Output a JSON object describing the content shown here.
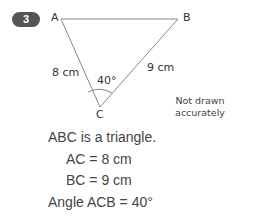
{
  "question_number": "3",
  "diagram": {
    "vertices": {
      "A": "A",
      "B": "B",
      "C": "C"
    },
    "side_labels": {
      "AC": "8 cm",
      "BC": "9 cm"
    },
    "angle_label": "40°",
    "note_line1": "Not drawn",
    "note_line2": "accurately"
  },
  "text": {
    "line1": "ABC is a triangle.",
    "line2": "AC = 8 cm",
    "line3": "BC = 9 cm",
    "line4": "Angle ACB = 40°"
  },
  "colors": {
    "badge": "#555555",
    "lines": "#888888",
    "text": "#444444"
  }
}
